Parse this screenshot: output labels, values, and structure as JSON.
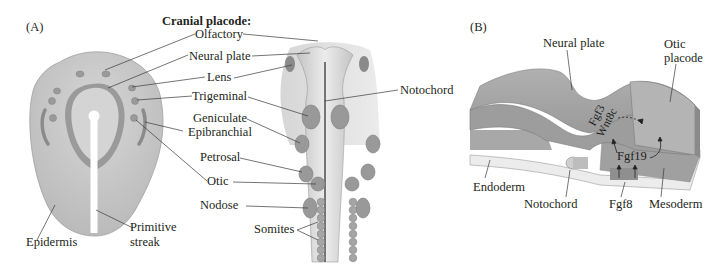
{
  "panel_a": {
    "tag": "(A)",
    "heading": "Cranial placode:",
    "labels": {
      "olfactory": "Olfactory",
      "neural_plate": "Neural plate",
      "lens": "Lens",
      "trigeminal": "Trigeminal",
      "geniculate": "Geniculate",
      "epibranchial": "Epibranchial",
      "petrosal": "Petrosal",
      "otic": "Otic",
      "nodose": "Nodose",
      "somites": "Somites",
      "notochord": "Notochord",
      "epidermis": "Epidermis",
      "primitive_streak_1": "Primitive",
      "primitive_streak_2": "streak"
    }
  },
  "panel_b": {
    "tag": "(B)",
    "labels": {
      "neural_plate": "Neural plate",
      "otic_placode_1": "Otic",
      "otic_placode_2": "placode",
      "fgf3": "Fgf3",
      "wnt8c": "Wnt8c",
      "fgf19": "Fgf19",
      "endoderm": "Endoderm",
      "notochord": "Notochord",
      "fgf8": "Fgf8",
      "mesoderm": "Mesoderm"
    }
  },
  "colors": {
    "tissue_light": "#d9d9d9",
    "tissue_mid": "#a8a8a8",
    "tissue_dark": "#8a8a8a",
    "placode": "#9a9a9a",
    "leader_line": "#3a3a3a"
  }
}
